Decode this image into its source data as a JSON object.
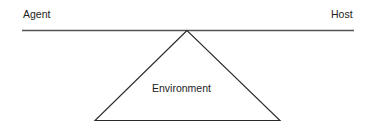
{
  "diagram": {
    "labels": {
      "agent": "Agent",
      "host": "Host",
      "environment": "Environment"
    },
    "colors": {
      "line": "#3a3a3a",
      "text": "#222222",
      "background": "#ffffff"
    }
  }
}
